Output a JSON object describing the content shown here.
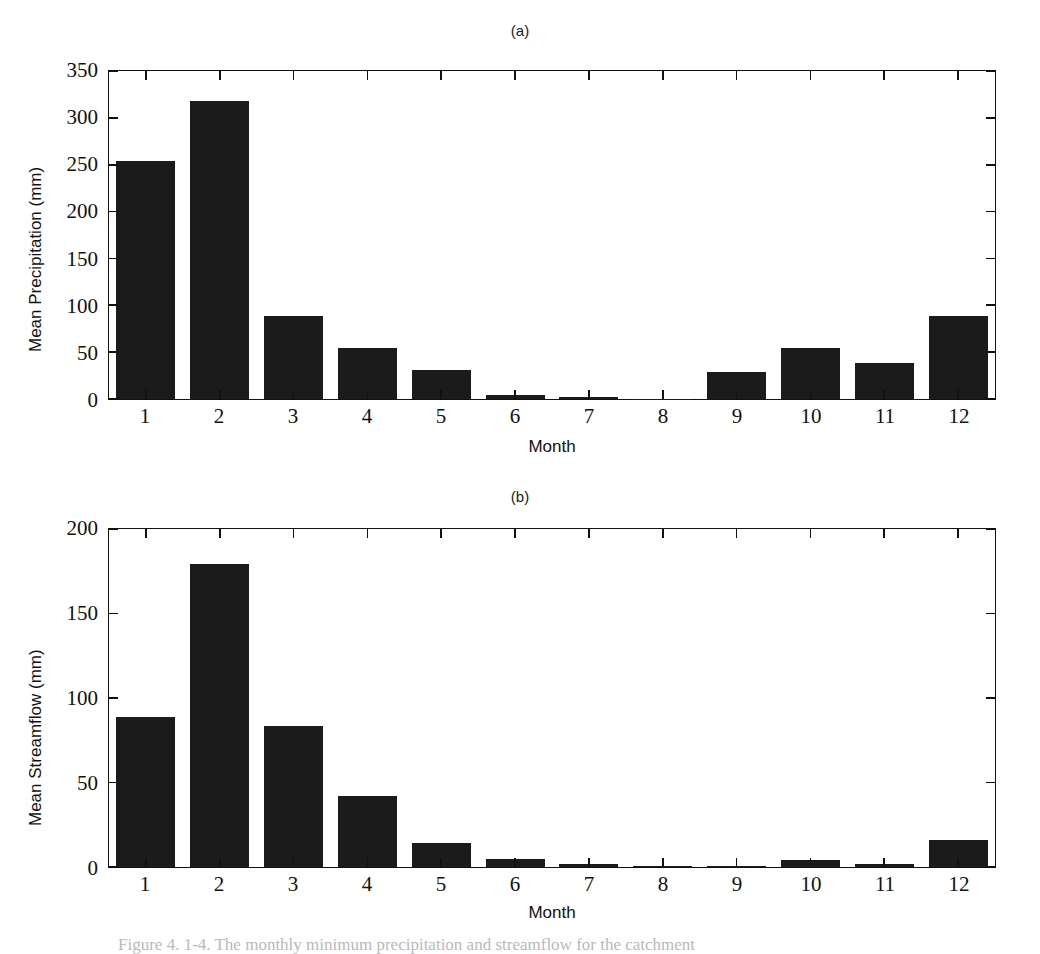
{
  "figure": {
    "caption_partial": "Figure 4. 1-4. The monthly minimum precipitation and streamflow for the catchment",
    "panels": [
      {
        "label": "(a)",
        "ylabel": "Mean Precipitation (mm)",
        "xlabel": "Month"
      },
      {
        "label": "(b)",
        "ylabel": "Mean Streamflow (mm)",
        "xlabel": "Month"
      }
    ]
  },
  "chart_data": [
    {
      "type": "bar",
      "title": "(a)",
      "xlabel": "Month",
      "ylabel": "Mean Precipitation (mm)",
      "categories": [
        "1",
        "2",
        "3",
        "4",
        "5",
        "6",
        "7",
        "8",
        "9",
        "10",
        "11",
        "12"
      ],
      "values": [
        252,
        316,
        88,
        54,
        31,
        4,
        2,
        0.5,
        29,
        54,
        38,
        88
      ],
      "ylim": [
        0,
        350
      ],
      "yticks": [
        0,
        50,
        100,
        150,
        200,
        250,
        300,
        350
      ],
      "ytick_labels": [
        "0",
        "50",
        "100",
        "150",
        "200",
        "250",
        "300",
        "350"
      ],
      "xlim": [
        0.5,
        12.5
      ],
      "grid": false,
      "legend": false,
      "bar_color": "#1b1b1b"
    },
    {
      "type": "bar",
      "title": "(b)",
      "xlabel": "Month",
      "ylabel": "Mean Streamflow (mm)",
      "categories": [
        "1",
        "2",
        "3",
        "4",
        "5",
        "6",
        "7",
        "8",
        "9",
        "10",
        "11",
        "12"
      ],
      "values": [
        88,
        178,
        83,
        42,
        14,
        5,
        1.5,
        0.5,
        0.5,
        4,
        2,
        16
      ],
      "ylim": [
        0,
        200
      ],
      "yticks": [
        0,
        50,
        100,
        150,
        200
      ],
      "ytick_labels": [
        "0",
        "50",
        "100",
        "150",
        "200"
      ],
      "xlim": [
        0.5,
        12.5
      ],
      "grid": false,
      "legend": false,
      "bar_color": "#1b1b1b"
    }
  ]
}
